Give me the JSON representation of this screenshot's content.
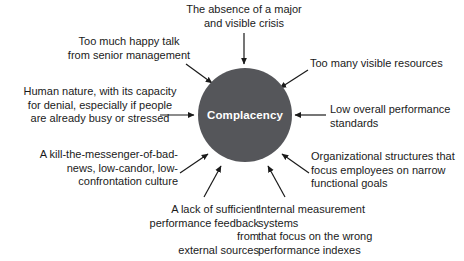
{
  "diagram": {
    "type": "hub-and-spoke-cause-diagram",
    "title": "Complacency",
    "background_color": "#ffffff",
    "hub": {
      "label": "Complacency",
      "fill_color": "#55565a",
      "text_color": "#ffffff",
      "shape": "circle",
      "center_x": 245,
      "center_y": 115,
      "radius": 47
    },
    "arrow_color": "#1a1a1a",
    "text_color": "#1a1a1a",
    "causes": [
      {
        "id": "absence-of-crisis",
        "text": "The absence of a major\nand visible crisis",
        "align": "center",
        "arrow": {
          "x1": 244,
          "y1": 33,
          "x2": 244,
          "y2": 64
        }
      },
      {
        "id": "too-much-happy-talk",
        "text": "Too much happy talk\nfrom senior management",
        "align": "center",
        "arrow": {
          "x1": 186,
          "y1": 64,
          "x2": 212,
          "y2": 83
        }
      },
      {
        "id": "human-nature-denial",
        "text": "Human nature, with its capacity\nfor denial, especially if people\nare already busy or stressed",
        "align": "center",
        "arrow": {
          "x1": 160,
          "y1": 115,
          "x2": 194,
          "y2": 115
        }
      },
      {
        "id": "kill-the-messenger-culture",
        "text": "A kill-the-messenger-of-bad-\nnews, low-candor, low-\nconfrontation culture",
        "align": "right",
        "arrow": {
          "x1": 180,
          "y1": 173,
          "x2": 208,
          "y2": 154
        }
      },
      {
        "id": "lack-of-feedback",
        "text": "A lack of sufficient\nperformance feedback from\nexternal sources",
        "align": "right",
        "arrow": {
          "x1": 204,
          "y1": 197,
          "x2": 221,
          "y2": 166
        }
      },
      {
        "id": "internal-measurement-systems",
        "text": "Internal measurement systems\nthat focus on the wrong\nperformance indexes",
        "align": "left",
        "arrow": {
          "x1": 285,
          "y1": 197,
          "x2": 268,
          "y2": 166
        }
      },
      {
        "id": "organizational-structures",
        "text": "Organizational structures that\nfocus employees on narrow\nfunctional goals",
        "align": "left",
        "arrow": {
          "x1": 309,
          "y1": 173,
          "x2": 282,
          "y2": 154
        }
      },
      {
        "id": "low-performance-standards",
        "text": "Low overall performance\nstandards",
        "align": "left",
        "arrow": {
          "x1": 326,
          "y1": 115,
          "x2": 295,
          "y2": 115
        }
      },
      {
        "id": "too-many-visible-resources",
        "text": "Too many visible resources",
        "align": "left",
        "arrow": {
          "x1": 308,
          "y1": 70,
          "x2": 280,
          "y2": 88
        }
      }
    ]
  }
}
